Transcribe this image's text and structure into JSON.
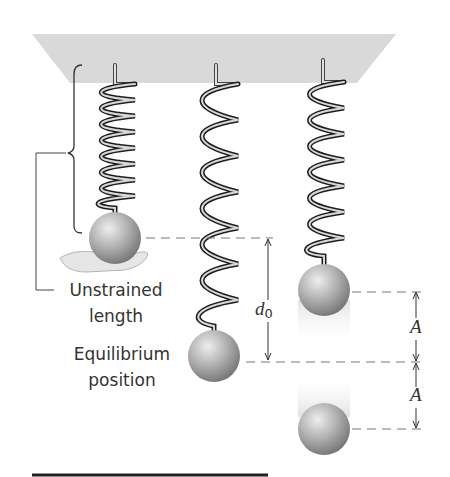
{
  "figure": {
    "labels": {
      "unstrained_line1": "Unstrained",
      "unstrained_line2": "length",
      "equilibrium_line1": "Equilibrium",
      "equilibrium_line2": "position",
      "d_symbol": "d",
      "d_subscript": "0",
      "amplitude_upper": "A",
      "amplitude_lower": "A"
    },
    "colors": {
      "ceiling": "#d9d9d9",
      "spring_dark": "#1e1e1e",
      "spring_light": "#d8d8d8",
      "ball_light": "#e6e6e6",
      "ball_dark": "#7a7a7a",
      "dash": "#777777",
      "text": "#333333"
    }
  }
}
